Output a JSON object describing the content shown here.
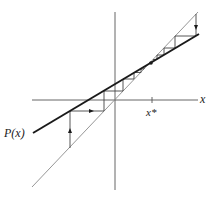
{
  "diagram": {
    "type": "cobweb",
    "labels": {
      "x_axis": "x",
      "fixed_point": "x*",
      "function": "P(x)"
    },
    "colors": {
      "axes": "#555555",
      "diagonal": "#8a8a8a",
      "function_line": "#1a1a1a",
      "cobweb": "#444444",
      "background": "#ffffff"
    },
    "axes": {
      "origin": [
        115,
        100
      ],
      "x_axis": {
        "from": [
          32,
          100
        ],
        "to": [
          198,
          100
        ]
      },
      "y_axis": {
        "from": [
          115,
          12
        ],
        "to": [
          115,
          190
        ]
      },
      "fixed_point_tick_x": 152
    },
    "diagonal_line": {
      "from": [
        32,
        187
      ],
      "to": [
        198,
        12
      ]
    },
    "function_line": {
      "from": [
        33,
        133
      ],
      "to": [
        199,
        34
      ]
    },
    "fixed_point": [
      151,
      63
    ],
    "cobweb_left": [
      [
        70,
        148
      ],
      [
        70,
        111
      ],
      [
        104,
        111
      ],
      [
        104,
        91
      ],
      [
        123,
        91
      ],
      [
        123,
        79
      ],
      [
        134,
        79
      ],
      [
        134,
        72.5
      ],
      [
        141,
        72.5
      ],
      [
        141,
        69
      ],
      [
        144,
        69
      ],
      [
        144,
        66.5
      ],
      [
        146,
        66.5
      ]
    ],
    "cobweb_right": [
      [
        196,
        14
      ],
      [
        196,
        36
      ],
      [
        175,
        36
      ],
      [
        175,
        48
      ],
      [
        164,
        48
      ],
      [
        164,
        55
      ],
      [
        157,
        55
      ],
      [
        157,
        59.5
      ],
      [
        153,
        59.5
      ]
    ],
    "arrows": [
      {
        "at": [
          70,
          131
        ],
        "direction": "up"
      },
      {
        "at": [
          91,
          111
        ],
        "direction": "right"
      },
      {
        "at": [
          196,
          27
        ],
        "direction": "down"
      }
    ]
  }
}
